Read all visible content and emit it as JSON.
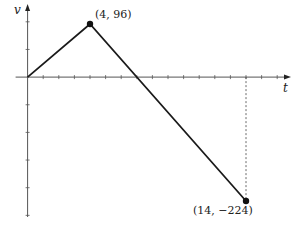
{
  "chart_data": {
    "type": "line",
    "title": "",
    "xlabel": "t",
    "ylabel": "v",
    "x": [
      0,
      4,
      14
    ],
    "series": [
      {
        "name": "v(t)",
        "values": [
          0,
          96,
          -224
        ]
      }
    ],
    "annotations": [
      {
        "point": [
          4,
          96
        ],
        "text": "(4, 96)"
      },
      {
        "point": [
          14,
          -224
        ],
        "text": "(14, −224)"
      }
    ],
    "xlim": [
      0,
      16.5
    ],
    "ylim": [
      -255,
      115
    ],
    "x_tick_step": 1,
    "y_tick_step": 50,
    "grid": false,
    "legend": false,
    "dashed_guide": {
      "x": 14,
      "from_y": 0,
      "to_y": -224
    }
  },
  "labels": {
    "x_axis": "t",
    "y_axis": "v",
    "peak": "(4, 96)",
    "end": "(14, −224)"
  }
}
